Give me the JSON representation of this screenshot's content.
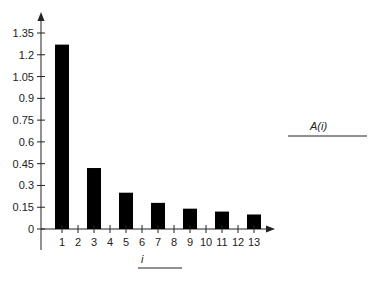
{
  "chart_data": {
    "type": "bar",
    "title": "",
    "xlabel": "i",
    "ylabel": "A(i)",
    "categories": [
      "1",
      "2",
      "3",
      "4",
      "5",
      "6",
      "7",
      "8",
      "9",
      "10",
      "11",
      "12",
      "13"
    ],
    "values": [
      1.27,
      0,
      0.42,
      0,
      0.25,
      0,
      0.18,
      0,
      0.14,
      0,
      0.12,
      0,
      0.1
    ],
    "yticks": [
      "0",
      "0.15",
      "0.3",
      "0.45",
      "0.6",
      "0.75",
      "0.9",
      "1.05",
      "1.2",
      "1.35"
    ],
    "ytick_values": [
      0,
      0.15,
      0.3,
      0.45,
      0.6,
      0.75,
      0.9,
      1.05,
      1.2,
      1.35
    ],
    "ylim": [
      0,
      1.35
    ],
    "grid": false,
    "legend": null,
    "bar_color": "#000000"
  }
}
